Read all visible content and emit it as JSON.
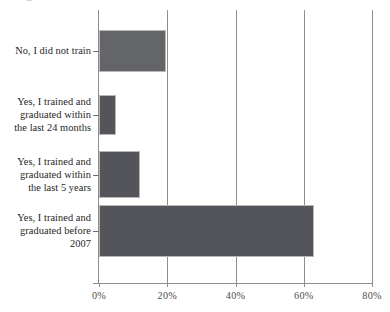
{
  "document": {
    "cropped_title_fragment": "graduated"
  },
  "chart_data": {
    "type": "bar",
    "orientation": "horizontal",
    "title": "",
    "subtitle": "",
    "xlabel": "",
    "ylabel": "",
    "categories": [
      "No, I did not train",
      "Yes, I trained and graduated within the last 24 months",
      "Yes, I trained and graduated within the last 5 years",
      "Yes, I trained and graduated before 2007"
    ],
    "category_lines": [
      [
        "No, I did not train"
      ],
      [
        "Yes, I trained and",
        "graduated within",
        "the last 24 months"
      ],
      [
        "Yes, I trained and",
        "graduated within",
        "the last 5 years"
      ],
      [
        "Yes, I trained and",
        "graduated before",
        "2007"
      ]
    ],
    "values": [
      19.5,
      5,
      12,
      63
    ],
    "value_labels": [
      "19.5%",
      "5%",
      "12%",
      "63%"
    ],
    "xlim": [
      0,
      80
    ],
    "xticks": [
      0,
      20,
      40,
      60,
      80
    ],
    "xtick_labels": [
      "0%",
      "20%",
      "40%",
      "60%",
      "80%"
    ],
    "grid": "vertical",
    "legend": "none",
    "bar_color": "#53555a",
    "bar_border_color": "#b8b8b8",
    "axis_color": "#8d8d8d",
    "text_color": "#262626"
  }
}
